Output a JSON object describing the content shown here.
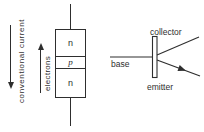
{
  "diagram": {
    "title_semantic": "npn-transistor-structure-and-symbol",
    "left_figure": {
      "conventional_current_label": "conventional current",
      "electrons_label": "electrons",
      "layers": [
        {
          "label": "n"
        },
        {
          "label": "p"
        },
        {
          "label": "n"
        }
      ]
    },
    "right_figure": {
      "collector_label": "collector",
      "base_label": "base",
      "emitter_label": "emitter"
    },
    "colors": {
      "line": "#2e2e2e",
      "text": "#2e2e2e",
      "background": "#ffffff"
    }
  }
}
